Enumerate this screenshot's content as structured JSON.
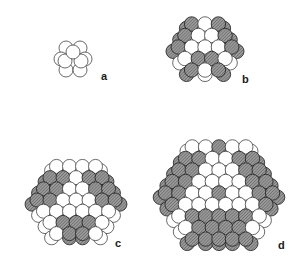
{
  "figure": {
    "colors": {
      "background": "#ffffff",
      "atom_fill": "#ffffff",
      "atom_outline": "#2a2a2a",
      "shaded_atom_fill": "#8c8c8c",
      "label": "#1a1a1a"
    },
    "panels": [
      {
        "id": "a",
        "label": "a",
        "label_x": 101,
        "label_y": 71,
        "cx": 73,
        "cy": 60,
        "r": 7.0,
        "shells": 1
      },
      {
        "id": "b",
        "label": "b",
        "label_x": 242,
        "label_y": 74,
        "cx": 205,
        "cy": 47,
        "r": 7.2,
        "shells": 2
      },
      {
        "id": "c",
        "label": "c",
        "label_x": 115,
        "label_y": 238,
        "cx": 76,
        "cy": 200,
        "r": 7.0,
        "shells": 3
      },
      {
        "id": "d",
        "label": "d",
        "label_x": 278,
        "label_y": 240,
        "cx": 219,
        "cy": 193,
        "r": 7.2,
        "shells": 4
      }
    ]
  }
}
